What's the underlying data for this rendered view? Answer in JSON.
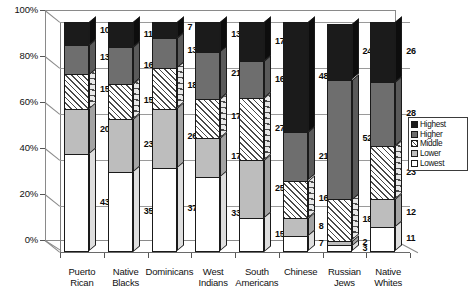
{
  "chart_data": {
    "type": "bar",
    "subtype": "stacked-percent-3d",
    "title": "",
    "xlabel": "",
    "ylabel": "",
    "ylim": [
      0,
      100
    ],
    "ytick_labels": [
      "0%",
      "20%",
      "40%",
      "60%",
      "80%",
      "100%"
    ],
    "ytick_values": [
      0,
      20,
      40,
      60,
      80,
      100
    ],
    "grid": true,
    "legend_position": "right",
    "stack_order_bottom_to_top": [
      "Lowest",
      "Lower",
      "Middle",
      "Higher",
      "Highest"
    ],
    "categories": [
      "Puerto\nRican",
      "Native\nBlacks",
      "Dominicans",
      "West\nIndians",
      "South\nAmericans",
      "Chinese",
      "Russian\nJews",
      "Native\nWhites"
    ],
    "series": [
      {
        "name": "Highest",
        "color": "#1b1b1b",
        "values": [
          10,
          11,
          7,
          13,
          17,
          48,
          24,
          26
        ]
      },
      {
        "name": "Higher",
        "color": "#6e6e6e",
        "values": [
          13,
          16,
          13,
          21,
          16,
          21,
          52,
          28
        ]
      },
      {
        "name": "Middle",
        "color": "#ffffff",
        "pattern": "diagonal-hatch",
        "values": [
          15,
          15,
          18,
          17,
          27,
          16,
          18,
          23
        ]
      },
      {
        "name": "Lower",
        "color": "#bdbdbd",
        "values": [
          20,
          23,
          26,
          17,
          25,
          8,
          2,
          12
        ]
      },
      {
        "name": "Lowest",
        "color": "#ffffff",
        "values": [
          43,
          35,
          37,
          33,
          15,
          7,
          3,
          11
        ]
      }
    ]
  },
  "legend": {
    "items": [
      {
        "label": "Highest",
        "swatch": "sw-highest"
      },
      {
        "label": "Higher",
        "swatch": "sw-higher"
      },
      {
        "label": "Middle",
        "swatch": "sw-middle"
      },
      {
        "label": "Lower",
        "swatch": "sw-lower"
      },
      {
        "label": "Lowest",
        "swatch": "sw-lowest"
      }
    ]
  }
}
